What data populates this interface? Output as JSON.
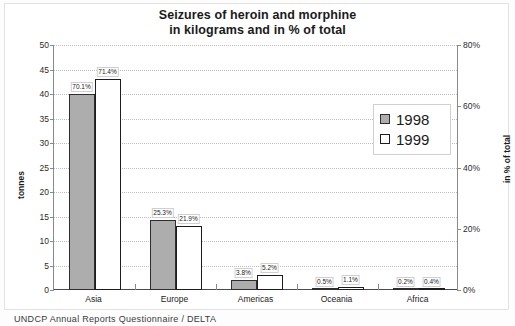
{
  "chart_data": {
    "type": "bar",
    "title": "Seizures of heroin and morphine in kilograms and in % of total",
    "title_line1": "Seizures of heroin and morphine",
    "title_line2": "in kilograms and in % of total",
    "categories": [
      "Asia",
      "Europe",
      "Americas",
      "Oceania",
      "Africa"
    ],
    "series": [
      {
        "name": "1998",
        "values": [
          40.0,
          14.2,
          2.1,
          0.3,
          0.1
        ],
        "labels": [
          "70.1%",
          "25.3%",
          "3.8%",
          "0.5%",
          "0.2%"
        ],
        "color": "#adadad"
      },
      {
        "name": "1999",
        "values": [
          43.0,
          13.0,
          3.1,
          0.6,
          0.2
        ],
        "labels": [
          "71.4%",
          "21.9%",
          "5.2%",
          "1.1%",
          "0.4%"
        ],
        "color": "#ffffff"
      }
    ],
    "xlabel": "",
    "ylabel": "tonnes",
    "ylabel_right": "in % of total",
    "ylim": [
      0,
      50
    ],
    "yticks": [
      0,
      5,
      10,
      15,
      20,
      25,
      30,
      35,
      40,
      45,
      50
    ],
    "ytick_labels": [
      "0",
      "5",
      "10",
      "15",
      "20",
      "25",
      "30",
      "35",
      "40",
      "45",
      "50"
    ],
    "ylim_right": [
      0,
      80
    ],
    "yticks_right": [
      0,
      20,
      40,
      60,
      80
    ],
    "ytick_labels_right": [
      "0%",
      "20%",
      "40%",
      "60%",
      "80%"
    ],
    "grid": true,
    "legend_position": "center-right"
  },
  "legend": {
    "items": [
      {
        "label": "1998",
        "style": "filled"
      },
      {
        "label": "1999",
        "style": "empty"
      }
    ]
  },
  "footer": {
    "source": "UNDCP Annual Reports Questionnaire / DELTA"
  }
}
